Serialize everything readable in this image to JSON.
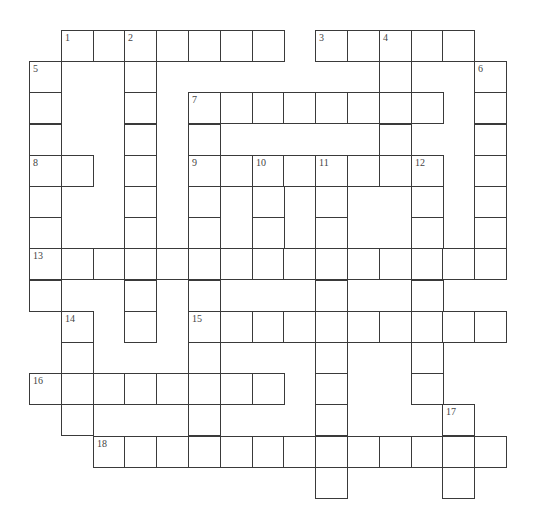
{
  "puzzle": {
    "type": "crossword",
    "grid": {
      "origin_x": 29,
      "origin_y": 30,
      "cell_w": 31.8,
      "cell_h": 31.2,
      "cells": [
        {
          "r": 0,
          "c": 1,
          "n": "1"
        },
        {
          "r": 0,
          "c": 2
        },
        {
          "r": 0,
          "c": 3,
          "n": "2"
        },
        {
          "r": 0,
          "c": 4
        },
        {
          "r": 0,
          "c": 5
        },
        {
          "r": 0,
          "c": 6
        },
        {
          "r": 0,
          "c": 7
        },
        {
          "r": 0,
          "c": 9,
          "n": "3"
        },
        {
          "r": 0,
          "c": 10
        },
        {
          "r": 0,
          "c": 11,
          "n": "4"
        },
        {
          "r": 0,
          "c": 12
        },
        {
          "r": 0,
          "c": 13
        },
        {
          "r": 1,
          "c": 0,
          "n": "5"
        },
        {
          "r": 1,
          "c": 3
        },
        {
          "r": 1,
          "c": 11
        },
        {
          "r": 1,
          "c": 14,
          "n": "6"
        },
        {
          "r": 2,
          "c": 0
        },
        {
          "r": 2,
          "c": 3
        },
        {
          "r": 2,
          "c": 5,
          "n": "7"
        },
        {
          "r": 2,
          "c": 6
        },
        {
          "r": 2,
          "c": 7
        },
        {
          "r": 2,
          "c": 8
        },
        {
          "r": 2,
          "c": 9
        },
        {
          "r": 2,
          "c": 10
        },
        {
          "r": 2,
          "c": 11
        },
        {
          "r": 2,
          "c": 12
        },
        {
          "r": 2,
          "c": 14
        },
        {
          "r": 3,
          "c": 0
        },
        {
          "r": 3,
          "c": 3
        },
        {
          "r": 3,
          "c": 5
        },
        {
          "r": 3,
          "c": 11
        },
        {
          "r": 3,
          "c": 14
        },
        {
          "r": 4,
          "c": 0,
          "n": "8"
        },
        {
          "r": 4,
          "c": 1
        },
        {
          "r": 4,
          "c": 3
        },
        {
          "r": 4,
          "c": 5,
          "n": "9"
        },
        {
          "r": 4,
          "c": 6
        },
        {
          "r": 4,
          "c": 7,
          "n": "10"
        },
        {
          "r": 4,
          "c": 8
        },
        {
          "r": 4,
          "c": 9,
          "n": "11"
        },
        {
          "r": 4,
          "c": 10
        },
        {
          "r": 4,
          "c": 11
        },
        {
          "r": 4,
          "c": 12,
          "n": "12"
        },
        {
          "r": 4,
          "c": 14
        },
        {
          "r": 5,
          "c": 0
        },
        {
          "r": 5,
          "c": 3
        },
        {
          "r": 5,
          "c": 5
        },
        {
          "r": 5,
          "c": 7
        },
        {
          "r": 5,
          "c": 9
        },
        {
          "r": 5,
          "c": 12
        },
        {
          "r": 5,
          "c": 14
        },
        {
          "r": 6,
          "c": 0
        },
        {
          "r": 6,
          "c": 3
        },
        {
          "r": 6,
          "c": 5
        },
        {
          "r": 6,
          "c": 7
        },
        {
          "r": 6,
          "c": 9
        },
        {
          "r": 6,
          "c": 12
        },
        {
          "r": 6,
          "c": 14
        },
        {
          "r": 7,
          "c": 0,
          "n": "13"
        },
        {
          "r": 7,
          "c": 1
        },
        {
          "r": 7,
          "c": 2
        },
        {
          "r": 7,
          "c": 3
        },
        {
          "r": 7,
          "c": 4
        },
        {
          "r": 7,
          "c": 5
        },
        {
          "r": 7,
          "c": 6
        },
        {
          "r": 7,
          "c": 7
        },
        {
          "r": 7,
          "c": 8
        },
        {
          "r": 7,
          "c": 9
        },
        {
          "r": 7,
          "c": 10
        },
        {
          "r": 7,
          "c": 11
        },
        {
          "r": 7,
          "c": 12
        },
        {
          "r": 7,
          "c": 13
        },
        {
          "r": 7,
          "c": 14
        },
        {
          "r": 8,
          "c": 0
        },
        {
          "r": 8,
          "c": 3
        },
        {
          "r": 8,
          "c": 5
        },
        {
          "r": 8,
          "c": 9
        },
        {
          "r": 8,
          "c": 12
        },
        {
          "r": 9,
          "c": 1,
          "n": "14"
        },
        {
          "r": 9,
          "c": 3
        },
        {
          "r": 9,
          "c": 5,
          "n": "15"
        },
        {
          "r": 9,
          "c": 6
        },
        {
          "r": 9,
          "c": 7
        },
        {
          "r": 9,
          "c": 8
        },
        {
          "r": 9,
          "c": 9
        },
        {
          "r": 9,
          "c": 10
        },
        {
          "r": 9,
          "c": 11
        },
        {
          "r": 9,
          "c": 12
        },
        {
          "r": 9,
          "c": 13
        },
        {
          "r": 9,
          "c": 14
        },
        {
          "r": 10,
          "c": 1
        },
        {
          "r": 10,
          "c": 5
        },
        {
          "r": 10,
          "c": 9
        },
        {
          "r": 10,
          "c": 12
        },
        {
          "r": 11,
          "c": 0,
          "n": "16"
        },
        {
          "r": 11,
          "c": 1
        },
        {
          "r": 11,
          "c": 2
        },
        {
          "r": 11,
          "c": 3
        },
        {
          "r": 11,
          "c": 4
        },
        {
          "r": 11,
          "c": 5
        },
        {
          "r": 11,
          "c": 6
        },
        {
          "r": 11,
          "c": 7
        },
        {
          "r": 11,
          "c": 9
        },
        {
          "r": 11,
          "c": 12
        },
        {
          "r": 12,
          "c": 1
        },
        {
          "r": 12,
          "c": 5
        },
        {
          "r": 12,
          "c": 9
        },
        {
          "r": 12,
          "c": 13,
          "n": "17"
        },
        {
          "r": 13,
          "c": 2,
          "n": "18"
        },
        {
          "r": 13,
          "c": 3
        },
        {
          "r": 13,
          "c": 4
        },
        {
          "r": 13,
          "c": 5
        },
        {
          "r": 13,
          "c": 6
        },
        {
          "r": 13,
          "c": 7
        },
        {
          "r": 13,
          "c": 8
        },
        {
          "r": 13,
          "c": 9
        },
        {
          "r": 13,
          "c": 10
        },
        {
          "r": 13,
          "c": 11
        },
        {
          "r": 13,
          "c": 12
        },
        {
          "r": 13,
          "c": 13
        },
        {
          "r": 13,
          "c": 14
        },
        {
          "r": 14,
          "c": 9
        },
        {
          "r": 14,
          "c": 13
        }
      ]
    },
    "clue_numbers": [
      "1",
      "2",
      "3",
      "4",
      "5",
      "6",
      "7",
      "8",
      "9",
      "10",
      "11",
      "12",
      "13",
      "14",
      "15",
      "16",
      "17",
      "18"
    ]
  }
}
